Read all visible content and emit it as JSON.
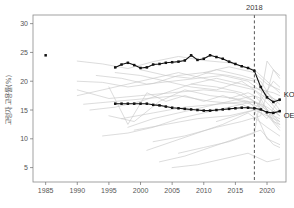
{
  "chart_data": {
    "type": "line",
    "title": "",
    "subtitle": "",
    "xlabel": "",
    "ylabel": "고령자 고용률(%)",
    "xlim": [
      1983,
      2023
    ],
    "ylim": [
      2.5,
      31.5
    ],
    "xticks": [
      1985,
      1990,
      1995,
      2000,
      2005,
      2010,
      2015,
      2020
    ],
    "yticks": [
      5,
      10,
      15,
      20,
      25,
      30
    ],
    "xtick_labels": [
      "1985",
      "1990",
      "1995",
      "2000",
      "2005",
      "2010",
      "2015",
      "2020"
    ],
    "ytick_labels": [
      "5",
      "10",
      "15",
      "20",
      "25",
      "30"
    ],
    "grid": false,
    "legend_position": "inline-right",
    "annotations": [
      {
        "name": "reference-year",
        "label": "2018",
        "x": 2018,
        "kind": "vertical-dashed-line"
      }
    ],
    "series": [
      {
        "name": "KOR",
        "label": "KOR",
        "color": "#111111",
        "emphasis": "highlight",
        "marker": "square",
        "x": [
          1985,
          1996,
          1997,
          1998,
          1999,
          2000,
          2001,
          2002,
          2003,
          2004,
          2005,
          2006,
          2007,
          2008,
          2009,
          2010,
          2011,
          2012,
          2013,
          2014,
          2015,
          2016,
          2017,
          2018,
          2019,
          2020,
          2021,
          2022
        ],
        "values": [
          24.5,
          22.4,
          22.9,
          23.2,
          22.8,
          22.3,
          22.4,
          22.9,
          23.0,
          23.2,
          23.3,
          23.4,
          23.6,
          24.5,
          23.7,
          23.9,
          24.5,
          24.2,
          23.9,
          23.4,
          23.0,
          22.6,
          22.3,
          21.8,
          19.0,
          17.2,
          16.4,
          16.8
        ]
      },
      {
        "name": "OECD",
        "label": "OECD",
        "color": "#111111",
        "emphasis": "highlight",
        "marker": "square",
        "x": [
          1996,
          1997,
          1998,
          1999,
          2000,
          2001,
          2002,
          2003,
          2004,
          2005,
          2006,
          2007,
          2008,
          2009,
          2010,
          2011,
          2012,
          2013,
          2014,
          2015,
          2016,
          2017,
          2018,
          2019,
          2020,
          2021,
          2022
        ],
        "values": [
          16.1,
          16.1,
          16.1,
          16.1,
          16.1,
          16.1,
          15.9,
          15.8,
          15.6,
          15.4,
          15.3,
          15.2,
          15.1,
          15.0,
          14.9,
          14.9,
          15.0,
          15.1,
          15.2,
          15.3,
          15.4,
          15.4,
          15.3,
          15.1,
          14.6,
          14.5,
          14.8
        ]
      },
      {
        "name": "country-01",
        "color": "#c9c9c9",
        "emphasis": "background",
        "x": [
          1990,
          1994,
          1998,
          2002,
          2006,
          2010,
          2014,
          2018,
          2022
        ],
        "values": [
          23.5,
          23.0,
          22.2,
          23.4,
          24.3,
          23.6,
          23.2,
          22.0,
          18.0
        ]
      },
      {
        "name": "country-02",
        "color": "#c9c9c9",
        "emphasis": "background",
        "x": [
          1990,
          1994,
          1998,
          2002,
          2006,
          2010,
          2014,
          2018,
          2022
        ],
        "values": [
          20.0,
          19.8,
          19.0,
          19.6,
          21.0,
          21.5,
          21.0,
          20.0,
          16.0
        ]
      },
      {
        "name": "country-03",
        "color": "#c9c9c9",
        "emphasis": "background",
        "x": [
          1990,
          1994,
          1998,
          2002,
          2006,
          2010,
          2014,
          2018,
          2022
        ],
        "values": [
          17.5,
          18.5,
          19.5,
          20.5,
          21.5,
          20.5,
          19.5,
          18.5,
          14.0
        ]
      },
      {
        "name": "country-04",
        "color": "#c9c9c9",
        "emphasis": "background",
        "x": [
          1992,
          1996,
          2000,
          2004,
          2008,
          2012,
          2016,
          2020,
          2022
        ],
        "values": [
          15.0,
          15.5,
          16.5,
          18.0,
          19.5,
          19.0,
          18.0,
          15.0,
          13.0
        ]
      },
      {
        "name": "country-05",
        "color": "#c9c9c9",
        "emphasis": "background",
        "x": [
          1995,
          1999,
          2003,
          2007,
          2011,
          2015,
          2019,
          2022
        ],
        "values": [
          14.0,
          13.0,
          16.5,
          18.5,
          17.5,
          17.0,
          16.0,
          12.5
        ]
      },
      {
        "name": "country-06",
        "color": "#c9c9c9",
        "emphasis": "background",
        "x": [
          1995,
          1998,
          2001,
          2004,
          2007,
          2010,
          2013,
          2016,
          2019,
          2022
        ],
        "values": [
          19.0,
          12.5,
          18.0,
          16.5,
          17.5,
          16.5,
          17.5,
          16.5,
          15.5,
          11.5
        ]
      },
      {
        "name": "country-07",
        "color": "#c9c9c9",
        "emphasis": "background",
        "x": [
          1996,
          2000,
          2004,
          2008,
          2012,
          2016,
          2020,
          2022
        ],
        "values": [
          21.5,
          21.0,
          20.0,
          19.0,
          18.5,
          20.0,
          17.0,
          14.5
        ]
      },
      {
        "name": "country-08",
        "color": "#c9c9c9",
        "emphasis": "background",
        "x": [
          1998,
          2002,
          2006,
          2010,
          2014,
          2018,
          2021,
          2022
        ],
        "values": [
          12.0,
          13.5,
          14.5,
          15.5,
          16.5,
          17.5,
          14.0,
          13.5
        ]
      },
      {
        "name": "country-09",
        "color": "#c9c9c9",
        "emphasis": "background",
        "x": [
          2000,
          2004,
          2008,
          2012,
          2016,
          2019,
          2021,
          2022
        ],
        "values": [
          22.0,
          21.0,
          20.5,
          22.0,
          21.0,
          20.0,
          16.5,
          15.0
        ]
      },
      {
        "name": "country-10",
        "color": "#c9c9c9",
        "emphasis": "background",
        "x": [
          1994,
          1998,
          2002,
          2006,
          2010,
          2014,
          2018,
          2022
        ],
        "values": [
          10.5,
          11.0,
          12.0,
          13.5,
          14.5,
          15.5,
          16.5,
          12.0
        ]
      },
      {
        "name": "country-11",
        "color": "#c9c9c9",
        "emphasis": "background",
        "x": [
          2001,
          2005,
          2009,
          2013,
          2017,
          2020,
          2022
        ],
        "values": [
          8.0,
          9.5,
          11.0,
          12.5,
          14.5,
          12.0,
          10.5
        ]
      },
      {
        "name": "country-12",
        "color": "#c9c9c9",
        "emphasis": "background",
        "x": [
          2003,
          2007,
          2011,
          2015,
          2019,
          2021,
          2022
        ],
        "values": [
          6.0,
          7.0,
          8.5,
          10.0,
          11.5,
          9.0,
          8.5
        ]
      },
      {
        "name": "country-13",
        "color": "#c9c9c9",
        "emphasis": "background",
        "x": [
          2005,
          2009,
          2013,
          2017,
          2020,
          2022
        ],
        "values": [
          5.0,
          5.5,
          6.5,
          7.5,
          6.0,
          6.5
        ]
      },
      {
        "name": "country-14",
        "color": "#c9c9c9",
        "emphasis": "background",
        "x": [
          1990,
          1995,
          2000,
          2005,
          2010,
          2015,
          2020,
          2022
        ],
        "values": [
          18.5,
          17.0,
          17.5,
          18.0,
          18.5,
          18.0,
          15.5,
          14.0
        ]
      },
      {
        "name": "country-15",
        "color": "#c9c9c9",
        "emphasis": "background",
        "x": [
          1991,
          1996,
          2001,
          2006,
          2011,
          2016,
          2020,
          2022
        ],
        "values": [
          16.0,
          16.5,
          17.0,
          17.5,
          16.5,
          16.0,
          14.0,
          13.0
        ]
      },
      {
        "name": "country-16",
        "color": "#c9c9c9",
        "emphasis": "background",
        "x": [
          1997,
          2002,
          2007,
          2012,
          2017,
          2020,
          2022
        ],
        "values": [
          13.5,
          14.5,
          15.5,
          16.0,
          16.5,
          13.5,
          17.0
        ]
      },
      {
        "name": "country-17",
        "color": "#c9c9c9",
        "emphasis": "background",
        "x": [
          1999,
          2004,
          2009,
          2014,
          2018,
          2021,
          2022
        ],
        "values": [
          11.5,
          12.5,
          13.5,
          14.0,
          15.0,
          20.0,
          19.0
        ]
      },
      {
        "name": "country-18",
        "color": "#c9c9c9",
        "emphasis": "background",
        "x": [
          2002,
          2007,
          2012,
          2016,
          2019,
          2021,
          2022
        ],
        "values": [
          9.5,
          10.5,
          12.0,
          13.0,
          14.0,
          22.0,
          21.0
        ]
      },
      {
        "name": "country-19",
        "color": "#c9c9c9",
        "emphasis": "background",
        "x": [
          2006,
          2010,
          2014,
          2018,
          2020,
          2022
        ],
        "values": [
          7.5,
          8.5,
          9.5,
          11.0,
          23.5,
          20.5
        ]
      },
      {
        "name": "country-20",
        "color": "#c9c9c9",
        "emphasis": "background",
        "x": [
          2008,
          2012,
          2016,
          2019,
          2021,
          2022
        ],
        "values": [
          19.5,
          20.5,
          19.5,
          18.5,
          18.0,
          17.5
        ]
      },
      {
        "name": "country-21",
        "color": "#c9c9c9",
        "emphasis": "background",
        "x": [
          2010,
          2014,
          2018,
          2020,
          2022
        ],
        "values": [
          21.5,
          22.5,
          21.5,
          19.5,
          18.5
        ]
      },
      {
        "name": "country-22",
        "color": "#c9c9c9",
        "emphasis": "background",
        "x": [
          1993,
          1997,
          2001,
          2005,
          2009,
          2013,
          2017,
          2020,
          2022
        ],
        "values": [
          21.0,
          20.5,
          19.5,
          20.0,
          20.5,
          21.0,
          20.0,
          17.5,
          16.5
        ]
      },
      {
        "name": "country-23",
        "color": "#c9c9c9",
        "emphasis": "background",
        "x": [
          2012,
          2015,
          2018,
          2020,
          2022
        ],
        "values": [
          13.0,
          14.0,
          15.0,
          10.0,
          9.0
        ]
      },
      {
        "name": "country-24",
        "color": "#c9c9c9",
        "emphasis": "background",
        "x": [
          2014,
          2017,
          2019,
          2021,
          2022
        ],
        "values": [
          17.0,
          18.0,
          17.0,
          13.0,
          12.5
        ]
      }
    ]
  },
  "caption": {
    "text": ""
  }
}
